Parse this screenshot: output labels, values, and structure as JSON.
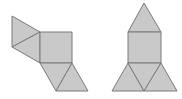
{
  "diagram": {
    "title": "",
    "colors": {
      "fill": "#c9c9c9",
      "stroke": "#7a7a7a",
      "background": "#ffffff"
    },
    "figures": [
      {
        "name": "net-left",
        "faces": [
          {
            "shape": "triangle",
            "points": "12,16 12,47 40,32"
          },
          {
            "shape": "triangle",
            "points": "12,47 40,32 40,63"
          },
          {
            "shape": "square",
            "points": "40,32 72,32 72,63 40,63"
          },
          {
            "shape": "triangle",
            "points": "40,63 72,63 56,91"
          },
          {
            "shape": "triangle",
            "points": "72,63 88,91 56,91"
          }
        ]
      },
      {
        "name": "net-right",
        "faces": [
          {
            "shape": "triangle",
            "points": "144,3 128,32 161,32"
          },
          {
            "shape": "square",
            "points": "128,32 161,32 161,63 128,63"
          },
          {
            "shape": "triangle",
            "points": "128,63 112,91 144,91"
          },
          {
            "shape": "triangle",
            "points": "128,63 161,63 144,91"
          },
          {
            "shape": "triangle",
            "points": "161,63 177,91 144,91"
          }
        ]
      }
    ]
  }
}
